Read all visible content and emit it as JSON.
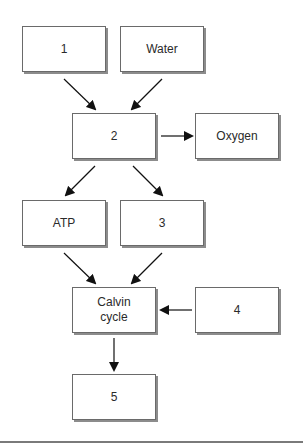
{
  "diagram": {
    "title": "",
    "type": "flowchart",
    "nodes": [
      {
        "id": "n1",
        "label": "1"
      },
      {
        "id": "water",
        "label": "Water"
      },
      {
        "id": "n2",
        "label": "2"
      },
      {
        "id": "oxygen",
        "label": "Oxygen"
      },
      {
        "id": "atp",
        "label": "ATP"
      },
      {
        "id": "n3",
        "label": "3"
      },
      {
        "id": "calvin",
        "label": "Calvin\ncycle"
      },
      {
        "id": "n4",
        "label": "4"
      },
      {
        "id": "n5",
        "label": "5"
      }
    ],
    "edges": [
      {
        "from": "n1",
        "to": "n2"
      },
      {
        "from": "water",
        "to": "n2"
      },
      {
        "from": "n2",
        "to": "oxygen"
      },
      {
        "from": "n2",
        "to": "atp"
      },
      {
        "from": "n2",
        "to": "n3"
      },
      {
        "from": "atp",
        "to": "calvin"
      },
      {
        "from": "n3",
        "to": "calvin"
      },
      {
        "from": "n4",
        "to": "calvin"
      },
      {
        "from": "calvin",
        "to": "n5"
      }
    ],
    "colors": {
      "border": "#6a6a6a",
      "shadow": "#8c8c8c",
      "text": "#2a2a2a",
      "arrow": "#111111"
    }
  }
}
